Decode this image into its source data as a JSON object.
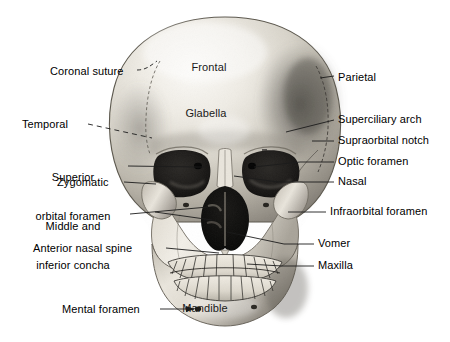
{
  "figure": {
    "background_color": "#ffffff",
    "text_color": "#000000",
    "leader_line_color": "#1c1c1c",
    "width": 450,
    "height": 342
  },
  "labels": {
    "left": [
      {
        "id": "coronal-suture",
        "text": "Coronal suture",
        "x": 50,
        "y": 66,
        "align": "left",
        "leader": {
          "x1": 137,
          "y1": 71,
          "x2": 160,
          "y2": 62,
          "style": "dashed-curve",
          "arrow": false
        }
      },
      {
        "id": "temporal",
        "text": "Temporal",
        "x": 22,
        "y": 118,
        "align": "left",
        "leader": {
          "x1": 88,
          "y1": 124,
          "x2": 150,
          "y2": 137,
          "style": "dashed",
          "arrow": false
        }
      },
      {
        "id": "superior-orbital-foramen",
        "text": "Superior\norbital foramen",
        "x": 18,
        "y": 145,
        "align": "left",
        "line1": "Superior",
        "line2": "orbital foramen",
        "leader": {
          "x1": 126,
          "y1": 166,
          "x2": 196,
          "y2": 166,
          "style": "solid",
          "arrow": false
        }
      },
      {
        "id": "zygomatic",
        "text": "Zygomatic",
        "x": 60,
        "y": 177,
        "align": "left",
        "leader": {
          "x1": 125,
          "y1": 182,
          "x2": 156,
          "y2": 182,
          "style": "solid",
          "arrow": false
        }
      },
      {
        "id": "middle-and-inferior-concha",
        "text": "Middle and\ninferior concha",
        "x": 18,
        "y": 194,
        "align": "left",
        "line1": "Middle and",
        "line2": "inferior concha",
        "leader": {
          "x1": 128,
          "y1": 215,
          "x2": 205,
          "y2": 208,
          "style": "solid",
          "arrow": false
        }
      },
      {
        "id": "anterior-nasal-spine",
        "text": "Anterior nasal spine",
        "x": 32,
        "y": 243,
        "align": "left",
        "leader": {
          "x1": 164,
          "y1": 248,
          "x2": 212,
          "y2": 248,
          "style": "solid",
          "arrow": false
        }
      },
      {
        "id": "mental-foramen",
        "text": "Mental foramen",
        "x": 62,
        "y": 304,
        "align": "left",
        "leader": {
          "x1": 160,
          "y1": 309,
          "x2": 196,
          "y2": 309,
          "style": "solid",
          "arrow": true
        }
      }
    ],
    "right": [
      {
        "id": "parietal",
        "text": "Parietal",
        "x": 338,
        "y": 73,
        "align": "left",
        "leader": {
          "x1": 318,
          "y1": 78,
          "x2": 330,
          "y2": 78,
          "style": "solid",
          "arrow": false
        }
      },
      {
        "id": "superciliary-arch",
        "text": "Superciliary arch",
        "x": 338,
        "y": 115,
        "align": "left",
        "leader": {
          "x1": 284,
          "y1": 131,
          "x2": 334,
          "y2": 120,
          "style": "solid",
          "arrow": false
        }
      },
      {
        "id": "supraorbital-notch",
        "text": "Supraorbital notch",
        "x": 338,
        "y": 136,
        "align": "left",
        "leader": {
          "x1": 314,
          "y1": 141,
          "x2": 334,
          "y2": 141,
          "style": "solid",
          "arrow": false
        }
      },
      {
        "id": "optic-foramen",
        "text": "Optic foramen",
        "x": 338,
        "y": 157,
        "align": "left",
        "leader": {
          "x1": 300,
          "y1": 162,
          "x2": 334,
          "y2": 162,
          "style": "solid",
          "arrow": false
        }
      },
      {
        "id": "nasal",
        "text": "Nasal",
        "x": 338,
        "y": 177,
        "align": "left",
        "leader": {
          "x1": 277,
          "y1": 182,
          "x2": 334,
          "y2": 182,
          "style": "solid",
          "arrow": false
        }
      },
      {
        "id": "infraorbital-foramen",
        "text": "Infraorbital foramen",
        "x": 330,
        "y": 207,
        "align": "left",
        "leader": {
          "x1": 289,
          "y1": 212,
          "x2": 326,
          "y2": 212,
          "style": "solid",
          "arrow": false
        }
      },
      {
        "id": "vomer",
        "text": "Vomer",
        "x": 318,
        "y": 239,
        "align": "left",
        "leader": {
          "x1": 285,
          "y1": 244,
          "x2": 314,
          "y2": 244,
          "style": "solid",
          "arrow": false
        }
      },
      {
        "id": "maxilla",
        "text": "Maxilla",
        "x": 318,
        "y": 261,
        "align": "left",
        "leader": {
          "x1": 283,
          "y1": 266,
          "x2": 314,
          "y2": 266,
          "style": "solid",
          "arrow": false
        }
      }
    ],
    "interior": [
      {
        "id": "frontal",
        "text": "Frontal",
        "x": 209,
        "y": 67,
        "align": "center"
      },
      {
        "id": "glabella",
        "text": "Glabella",
        "x": 206,
        "y": 113,
        "align": "center"
      },
      {
        "id": "mandible",
        "text": "Mandible",
        "x": 204,
        "y": 308,
        "align": "center"
      }
    ]
  },
  "anatomy_parts": [
    "Coronal suture",
    "Frontal",
    "Parietal",
    "Temporal",
    "Glabella",
    "Superciliary arch",
    "Supraorbital notch",
    "Superior orbital foramen",
    "Optic foramen",
    "Zygomatic",
    "Nasal",
    "Middle and inferior concha",
    "Infraorbital foramen",
    "Anterior nasal spine",
    "Vomer",
    "Maxilla",
    "Mental foramen",
    "Mandible"
  ]
}
